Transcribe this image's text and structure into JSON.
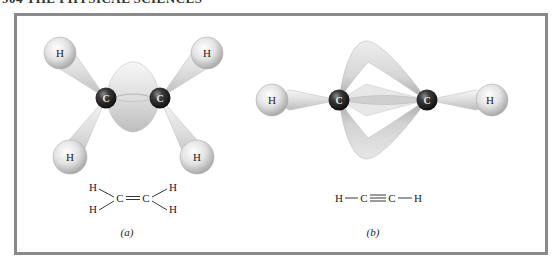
{
  "page": {
    "running_head": "904  THE PHYSICAL SCIENCES"
  },
  "figure": {
    "panels": [
      {
        "id": "a",
        "label": "(a)",
        "molecule": "ethylene",
        "model": {
          "carbons": [
            {
              "symbol": "C",
              "x": 106,
              "y": 98
            },
            {
              "symbol": "C",
              "x": 160,
              "y": 98
            }
          ],
          "hydrogens": [
            {
              "symbol": "H",
              "x": 60,
              "y": 53
            },
            {
              "symbol": "H",
              "x": 207,
              "y": 53
            },
            {
              "symbol": "H",
              "x": 70,
              "y": 157
            },
            {
              "symbol": "H",
              "x": 197,
              "y": 157
            }
          ]
        },
        "formula": {
          "atoms": [
            {
              "symbol": "H",
              "x": 93,
              "y": 191
            },
            {
              "symbol": "H",
              "x": 93,
              "y": 213
            },
            {
              "symbol": "C",
              "x": 120,
              "y": 202
            },
            {
              "symbol": "C",
              "x": 146,
              "y": 202
            },
            {
              "symbol": "H",
              "x": 173,
              "y": 191
            },
            {
              "symbol": "H",
              "x": 173,
              "y": 213
            }
          ],
          "bond_type": "double"
        }
      },
      {
        "id": "b",
        "label": "(b)",
        "molecule": "acetylene",
        "model": {
          "carbons": [
            {
              "symbol": "C",
              "x": 339,
              "y": 100
            },
            {
              "symbol": "C",
              "x": 427,
              "y": 100
            }
          ],
          "hydrogens": [
            {
              "symbol": "H",
              "x": 272,
              "y": 100
            },
            {
              "symbol": "H",
              "x": 492,
              "y": 100
            }
          ]
        },
        "formula": {
          "atoms": [
            {
              "symbol": "H",
              "x": 339,
              "y": 202
            },
            {
              "symbol": "C",
              "x": 364,
              "y": 202
            },
            {
              "symbol": "C",
              "x": 392,
              "y": 202
            },
            {
              "symbol": "H",
              "x": 418,
              "y": 202
            }
          ],
          "bond_type": "triple"
        }
      }
    ]
  },
  "colors": {
    "frame": "#8a8a8a",
    "carbon": "#1c1c1c",
    "orbital_light": "#f4f4f4",
    "orbital_shadow": "#b5b5b5",
    "text": "#222222"
  }
}
